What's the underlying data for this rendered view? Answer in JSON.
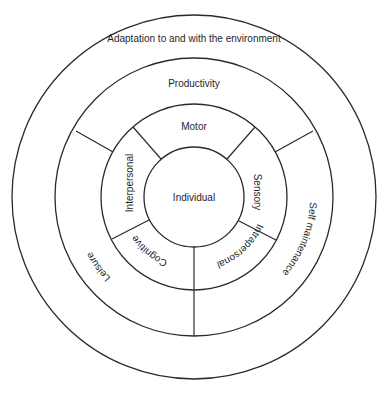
{
  "diagram": {
    "type": "concentric-ring-model",
    "center_label": "Individual",
    "rings": [
      {
        "level": 1,
        "name": "inner-performance-components",
        "segments": [
          {
            "label": "Motor",
            "position": "top"
          },
          {
            "label": "Sensory",
            "position": "right"
          },
          {
            "label": "Cognitive",
            "position": "bottom-right"
          },
          {
            "label": "Intrapersonal",
            "position": "bottom-left"
          },
          {
            "label": "Interpersonal",
            "position": "left"
          }
        ]
      },
      {
        "level": 2,
        "name": "occupational-performance-areas",
        "segments": [
          {
            "label": "Productivity",
            "position": "top"
          },
          {
            "label": "Leisure",
            "position": "bottom-right"
          },
          {
            "label": "Self maintenance",
            "position": "bottom-left"
          }
        ]
      },
      {
        "level": 3,
        "name": "environment",
        "segments": [
          {
            "label": "Adaptation to and with the environment",
            "position": "top"
          }
        ]
      }
    ],
    "colors": {
      "stroke": "#2a2a2a",
      "text": "#1f1f1f",
      "background": "#ffffff"
    }
  },
  "labels": {
    "center": "Individual",
    "motor": "Motor",
    "sensory": "Sensory",
    "cognitive": "Cognitive",
    "intrapersonal": "Intrapersonal",
    "interpersonal": "Interpersonal",
    "productivity": "Productivity",
    "leisure": "Leisure",
    "self_maintenance": "Self maintenance",
    "environment": "Adaptation to and with the environment"
  }
}
